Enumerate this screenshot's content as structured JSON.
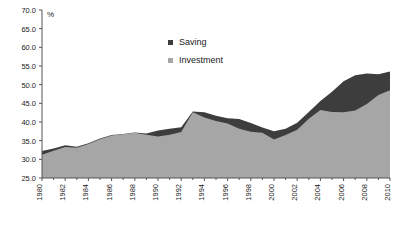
{
  "chart_data": {
    "type": "area",
    "title": "",
    "subtitle": "",
    "xlabel": "",
    "ylabel": "%",
    "ylim": [
      25.0,
      70.0
    ],
    "xlim": [
      1980,
      2010
    ],
    "grid": false,
    "legend_position": "top-center",
    "y_ticks": [
      "25.0",
      "30.0",
      "35.0",
      "40.0",
      "45.0",
      "50.0",
      "55.0",
      "60.0",
      "65.0",
      "70.0"
    ],
    "x_ticks": [
      "1980",
      "1982",
      "1984",
      "1986",
      "1988",
      "1990",
      "1992",
      "1994",
      "1996",
      "1998",
      "2000",
      "2002",
      "2004",
      "2006",
      "2008",
      "2010"
    ],
    "x_minor_ticks": [
      1981,
      1983,
      1985,
      1987,
      1989,
      1991,
      1993,
      1995,
      1997,
      1999,
      2001,
      2003,
      2005,
      2007,
      2009
    ],
    "x": [
      1980,
      1981,
      1982,
      1983,
      1984,
      1985,
      1986,
      1987,
      1988,
      1989,
      1990,
      1991,
      1992,
      1993,
      1994,
      1995,
      1996,
      1997,
      1998,
      1999,
      2000,
      2001,
      2002,
      2003,
      2004,
      2005,
      2006,
      2007,
      2008,
      2009,
      2010
    ],
    "series": [
      {
        "name": "Saving",
        "color": "#3d3d3d",
        "values": [
          32.2,
          32.9,
          33.8,
          33.4,
          34.3,
          35.6,
          36.5,
          36.8,
          37.2,
          36.9,
          37.7,
          38.2,
          38.6,
          42.8,
          42.6,
          41.7,
          41.0,
          40.8,
          39.7,
          38.5,
          37.5,
          38.2,
          39.8,
          42.7,
          45.6,
          48.1,
          50.9,
          52.5,
          53.0,
          52.8,
          53.5
        ]
      },
      {
        "name": "Investment",
        "color": "#a6a6a6",
        "values": [
          31.2,
          32.3,
          33.3,
          33.1,
          34.1,
          35.4,
          36.4,
          36.7,
          37.1,
          36.6,
          36.1,
          36.6,
          37.3,
          42.6,
          41.2,
          40.3,
          39.6,
          38.2,
          37.4,
          37.1,
          35.3,
          36.5,
          37.9,
          40.9,
          43.2,
          42.7,
          42.6,
          43.1,
          44.8,
          47.2,
          48.5
        ]
      }
    ],
    "legend": [
      {
        "label": "Saving",
        "color": "#3d3d3d",
        "marker": "square"
      },
      {
        "label": "Investment",
        "color": "#a6a6a6",
        "marker": "square"
      }
    ]
  }
}
